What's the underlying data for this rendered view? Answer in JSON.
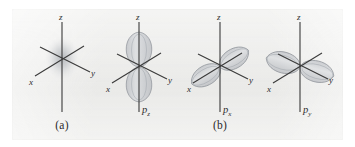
{
  "figure": {
    "background_color": "#ffffff",
    "plate_color": "#efefed",
    "axis_color": "#3a3a3a",
    "lobe_color": "#b9bcc4",
    "lobe_edge_color": "#8d9198",
    "cloud_color": "#9aa0a8"
  },
  "captions": [
    {
      "id": "caption-a",
      "text": "(a)"
    },
    {
      "id": "caption-b",
      "text": "(b)"
    }
  ],
  "panels": [
    {
      "id": "panel-s-orbital",
      "orbital_label": "",
      "orbital_sub": "",
      "caption": "(a)",
      "type": "s",
      "axes": [
        {
          "name": "z",
          "label": "z",
          "direction": "up"
        },
        {
          "name": "y",
          "label": "y",
          "direction": "lower-right"
        },
        {
          "name": "x",
          "label": "x",
          "direction": "lower-left"
        }
      ]
    },
    {
      "id": "panel-pz-orbital",
      "orbital_label": "p",
      "orbital_sub": "z",
      "caption": "",
      "type": "p",
      "axes": [
        {
          "name": "z",
          "label": "z",
          "direction": "up"
        },
        {
          "name": "y",
          "label": "y",
          "direction": "lower-right"
        },
        {
          "name": "x",
          "label": "x",
          "direction": "lower-left"
        }
      ]
    },
    {
      "id": "panel-px-orbital",
      "orbital_label": "p",
      "orbital_sub": "x",
      "caption": "(b)",
      "type": "p",
      "axes": [
        {
          "name": "z",
          "label": "z",
          "direction": "up"
        },
        {
          "name": "y",
          "label": "y",
          "direction": "lower-right"
        },
        {
          "name": "x",
          "label": "x",
          "direction": "lower-left"
        }
      ]
    },
    {
      "id": "panel-py-orbital",
      "orbital_label": "p",
      "orbital_sub": "y",
      "caption": "",
      "type": "p",
      "axes": [
        {
          "name": "z",
          "label": "z",
          "direction": "up"
        },
        {
          "name": "y",
          "label": "y",
          "direction": "lower-right"
        },
        {
          "name": "x",
          "label": "x",
          "direction": "lower-left"
        }
      ]
    }
  ]
}
